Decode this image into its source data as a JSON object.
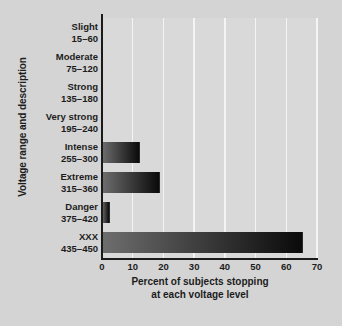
{
  "chart_data": {
    "type": "bar",
    "orientation": "horizontal",
    "title": "",
    "xlabel_line1": "Percent of subjects stopping",
    "xlabel_line2": "at each voltage level",
    "ylabel": "Voltage range and description",
    "xlim": [
      0,
      70
    ],
    "xticks": [
      0,
      10,
      20,
      30,
      40,
      50,
      60,
      70
    ],
    "xtick_labels": [
      "0",
      "10",
      "20",
      "30",
      "40",
      "50",
      "60",
      "70"
    ],
    "grid": "vertical-white",
    "legend": "none",
    "categories": [
      "Slight",
      "Moderate",
      "Strong",
      "Very strong",
      "Intense",
      "Extreme",
      "Danger",
      "XXX"
    ],
    "category_ranges": [
      "15–60",
      "75–120",
      "135–180",
      "195–240",
      "255–300",
      "315–360",
      "375–420",
      "435–450"
    ],
    "values": [
      0,
      0,
      0,
      0,
      12.5,
      19,
      2.5,
      65.5
    ],
    "bar_gradient_from": "#6e6e6e",
    "bar_gradient_to": "#0a0a0a",
    "background_color": "#d4d4d4",
    "plot_background_color": "#d9d9d9",
    "gridline_color": "#f4f4f4",
    "axis_color": "#1a1a1a",
    "text_color": "#1c1c1c"
  }
}
